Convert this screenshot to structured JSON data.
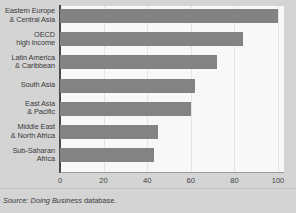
{
  "chart_data": {
    "type": "bar",
    "orientation": "horizontal",
    "title": "",
    "xlabel": "",
    "ylabel": "",
    "xlim": [
      0,
      100
    ],
    "xticks": [
      0,
      20,
      40,
      60,
      80,
      100
    ],
    "grid": true,
    "legend": null,
    "categories": [
      "Eastern Europe\n& Central Asia",
      "OECD\nhigh income",
      "Latin America\n& Caribbean",
      "South Asia",
      "East Asia\n& Pacific",
      "Middle East\n& North Africa",
      "Sub-Saharan\nAfrica"
    ],
    "values": [
      100,
      84,
      72,
      62,
      60,
      45,
      43
    ],
    "bar_color": "#838383"
  },
  "category_labels": [
    {
      "line1": "Eastern Europe",
      "line2": "& Central Asia"
    },
    {
      "line1": "OECD",
      "line2": "high income"
    },
    {
      "line1": "Latin America",
      "line2": "& Caribbean"
    },
    {
      "line1": "South Asia",
      "line2": ""
    },
    {
      "line1": "East Asia",
      "line2": "& Pacific"
    },
    {
      "line1": "Middle East",
      "line2": "& North Africa"
    },
    {
      "line1": "Sub-Saharan",
      "line2": "Africa"
    }
  ],
  "tick_labels": [
    "0",
    "20",
    "40",
    "60",
    "80",
    "100"
  ],
  "source": {
    "prefix": "Source:",
    "italic_part": "Doing Business",
    "suffix": "database."
  },
  "colors": {
    "bar": "#838383",
    "plot_background": "#f8f8f8",
    "figure_background": "#d4d4d4",
    "axis": "#4a4a4a",
    "text": "#3a3a3a"
  }
}
